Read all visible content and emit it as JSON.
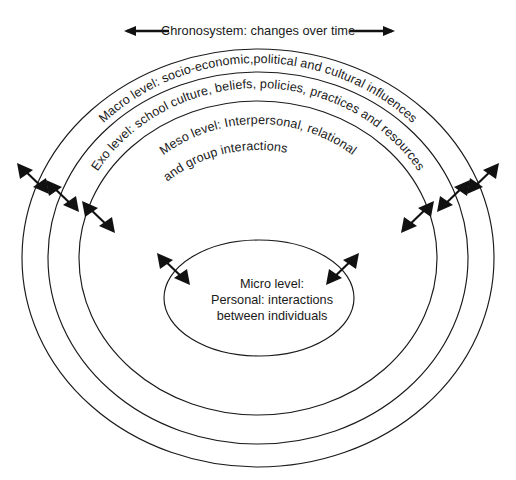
{
  "diagram": {
    "title_text": "Chronosystem: changes over time",
    "background_color": "#ffffff",
    "line_color": "#1a1a1a",
    "text_color": "#1a1a1a",
    "chronosystem": {
      "label": "Chronosystem: changes over time",
      "left_arrow_icon": "arrow-left-icon",
      "right_arrow_icon": "arrow-right-icon"
    },
    "rings": [
      {
        "id": "macro",
        "level_name": "Macro level",
        "label": "Macro level: socio-economic,political and cultural influences",
        "order": 1
      },
      {
        "id": "exo",
        "level_name": "Exo level",
        "label": "Exo level: school culture, beliefs, policies, practices and resources",
        "order": 2
      },
      {
        "id": "meso",
        "level_name": "Meso level",
        "label_line_1": "Meso level: Interpersonal, relational",
        "label_line_2": "and group interactions",
        "order": 3
      },
      {
        "id": "micro",
        "level_name": "Micro level",
        "label_line_1": "Micro level:",
        "label_line_2": "Personal: interactions",
        "label_line_3": "between individuals",
        "order": 4
      }
    ],
    "interaction_arrows": {
      "description": "double-headed arrows crossing each ring boundary",
      "icon": "double-headed-arrow-icon",
      "count_left": 4,
      "count_right": 4
    }
  }
}
